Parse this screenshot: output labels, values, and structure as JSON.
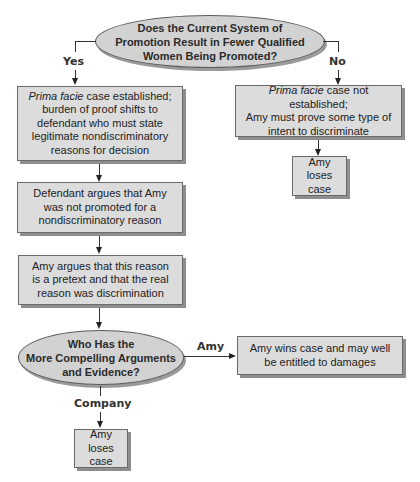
{
  "diagram": {
    "type": "flowchart",
    "decision1": {
      "lines": [
        "Does the Current System of",
        "Promotion Result in Fewer Qualified",
        "Women Being Promoted?"
      ],
      "yes_label": "Yes",
      "no_label": "No"
    },
    "yes_branch": {
      "box1": {
        "italic_prefix": "Prima facie",
        "lines_rest": [
          " case established;",
          "burden of proof shifts to",
          "defendant who must state",
          "legitimate nondiscriminatory",
          "reasons for decision"
        ]
      },
      "box2": {
        "lines": [
          "Defendant argues that Amy",
          "was not promoted for a",
          "nondiscriminatory reason"
        ]
      },
      "box3": {
        "lines": [
          "Amy argues that this reason",
          "is a pretext and that the real",
          "reason was discrimination"
        ]
      }
    },
    "no_branch": {
      "box1": {
        "italic_prefix": "Prima facie",
        "lines_rest": [
          " case not established;",
          "Amy must prove some type of",
          "intent to discriminate"
        ]
      },
      "outcome": {
        "lines": [
          "Amy",
          "loses case"
        ]
      }
    },
    "decision2": {
      "lines": [
        "Who Has the",
        "More Compelling Arguments",
        "and Evidence?"
      ],
      "amy_label": "Amy",
      "company_label": "Company"
    },
    "amy_outcome": {
      "lines": [
        "Amy wins case and may well",
        "be entitled to damages"
      ]
    },
    "company_outcome": {
      "lines": [
        "Amy",
        "loses case"
      ]
    }
  },
  "colors": {
    "box_fill": "#dcdcdc",
    "ellipse_fill": "#d2d2d2",
    "border": "#6a6a6a",
    "shadow": "#8e8e8e"
  }
}
